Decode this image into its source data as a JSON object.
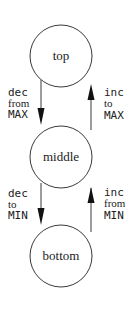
{
  "diagram": {
    "type": "state-machine",
    "nodes": [
      {
        "id": "top",
        "label": "top"
      },
      {
        "id": "middle",
        "label": "middle"
      },
      {
        "id": "bottom",
        "label": "bottom"
      }
    ],
    "edges": [
      {
        "from": "top",
        "to": "middle",
        "label": [
          "dec",
          "from",
          "MAX"
        ]
      },
      {
        "from": "middle",
        "to": "top",
        "label": [
          "inc",
          "to",
          "MAX"
        ]
      },
      {
        "from": "middle",
        "to": "bottom",
        "label": [
          "dec",
          "to",
          "MIN"
        ]
      },
      {
        "from": "bottom",
        "to": "middle",
        "label": [
          "inc",
          "from",
          "MIN"
        ]
      }
    ],
    "colors": {
      "stroke": "#3a3a3a",
      "text": "#222222",
      "background": "#ffffff"
    }
  }
}
